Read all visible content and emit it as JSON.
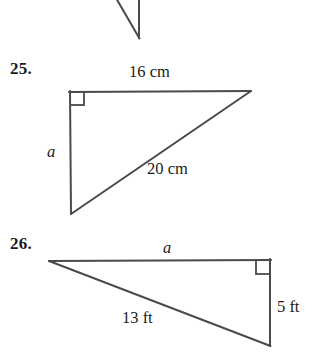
{
  "page": {
    "background_color": "#ffffff",
    "line_color": "#4a4a4a",
    "text_color": "#1b1b1b",
    "width": 311,
    "height": 354
  },
  "partial_figure_top": {
    "description": "partial-triangle-cut-off",
    "geometry": {
      "vertical_edge": {
        "x": 139,
        "y1": 0,
        "y2": 38
      },
      "diagonal_edge": {
        "x1": 117,
        "y1": 0,
        "x2": 139,
        "y2": 38
      }
    }
  },
  "problems": [
    {
      "number": "25.",
      "figure_type": "right-triangle",
      "right_angle_at": "top-left",
      "labels": {
        "top_side": "16 cm",
        "vertical_leg": "a",
        "hypotenuse": "20 cm"
      },
      "geometry": {
        "vertices": {
          "right_angle_corner": {
            "x": 70,
            "y": 92
          },
          "top_right": {
            "x": 250,
            "y": 91
          },
          "bottom_left": {
            "x": 71,
            "y": 213
          }
        },
        "right_angle_marker_size": 13
      }
    },
    {
      "number": "26.",
      "figure_type": "right-triangle",
      "right_angle_at": "top-right",
      "labels": {
        "top_side": "a",
        "hypotenuse": "13 ft",
        "vertical_leg": "5 ft"
      },
      "geometry": {
        "vertices": {
          "left": {
            "x": 50,
            "y": 261
          },
          "right_angle_corner": {
            "x": 270,
            "y": 260
          },
          "bottom_right": {
            "x": 270,
            "y": 345
          }
        },
        "right_angle_marker_size": 13
      }
    }
  ]
}
